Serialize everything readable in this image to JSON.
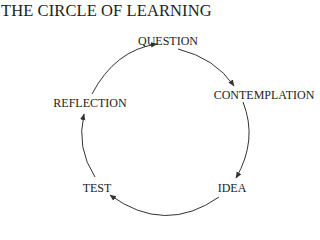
{
  "title": "THE CIRCLE OF LEARNING",
  "nodes": [
    {
      "id": "question",
      "label": "QUESTION"
    },
    {
      "id": "contemplation",
      "label": "CONTEMPLATION"
    },
    {
      "id": "idea",
      "label": "IDEA"
    },
    {
      "id": "test",
      "label": "TEST"
    },
    {
      "id": "reflection",
      "label": "REFLECTION"
    }
  ],
  "edges": [
    {
      "from": "QUESTION",
      "to": "CONTEMPLATION"
    },
    {
      "from": "CONTEMPLATION",
      "to": "IDEA"
    },
    {
      "from": "IDEA",
      "to": "TEST"
    },
    {
      "from": "TEST",
      "to": "REFLECTION"
    },
    {
      "from": "REFLECTION",
      "to": "QUESTION"
    }
  ],
  "colors": {
    "text": "#222222",
    "arrow": "#333333",
    "background": "#ffffff"
  }
}
